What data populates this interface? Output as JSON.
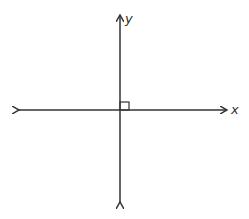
{
  "diagram": {
    "axes": {
      "x_label": "x",
      "y_label": "y"
    },
    "right_angle_marker": true,
    "colors": {
      "line": "#333333",
      "background": "#ffffff"
    }
  }
}
